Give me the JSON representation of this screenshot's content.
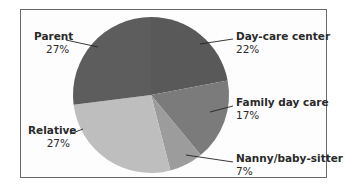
{
  "chart_data": {
    "type": "pie",
    "title": "",
    "categories": [
      "Day-care center",
      "Family day care",
      "Nanny/baby-sitter",
      "Relative",
      "Parent"
    ],
    "values": [
      22,
      17,
      7,
      27,
      27
    ],
    "value_labels": [
      "22%",
      "17%",
      "7%",
      "27%",
      "27%"
    ],
    "colors": [
      "#595959",
      "#7b7b7b",
      "#9c9c9c",
      "#bebebe",
      "#5d5d5d"
    ],
    "start_angle_deg": 0,
    "direction": "clockwise",
    "legend": "none (direct labels with leader lines)"
  },
  "labels": {
    "daycare": {
      "name": "Day-care center",
      "pct": "22%"
    },
    "family": {
      "name": "Family day care",
      "pct": "17%"
    },
    "nanny": {
      "name": "Nanny/baby-sitter",
      "pct": "7%"
    },
    "relative": {
      "name": "Relative",
      "pct": "27%"
    },
    "parent": {
      "name": "Parent",
      "pct": "27%"
    }
  }
}
